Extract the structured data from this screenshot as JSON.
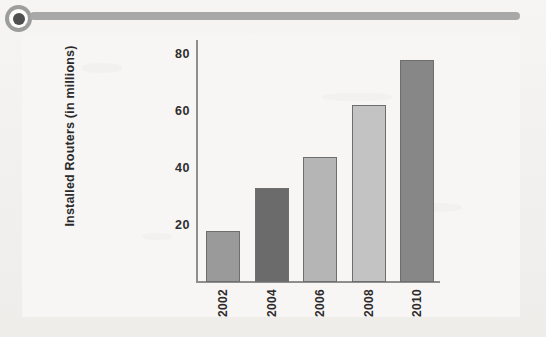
{
  "page": {
    "background_color": "#f3f2f0",
    "panel_color": "#f7f6f4"
  },
  "ornament": {
    "target_icon_name": "target-icon",
    "rule_color": "#a8a8a8",
    "icon_ring_color": "#9d9d9d",
    "icon_core_color": "#4f4f4f"
  },
  "chart_data": {
    "type": "bar",
    "title": "",
    "xlabel": "",
    "ylabel": "Installed Routers (in millions)",
    "categories": [
      "2002",
      "2004",
      "2006",
      "2008",
      "2010"
    ],
    "values": [
      18,
      33,
      44,
      62,
      78
    ],
    "ylim": [
      0,
      86
    ],
    "yticks": [
      20,
      40,
      60,
      80
    ],
    "ytick_labels": [
      "20",
      "40",
      "60",
      "80"
    ],
    "grid": false,
    "legend": false,
    "legend_position": "none",
    "bar_colors": [
      "#9a9a9a",
      "#6b6b6b",
      "#b5b5b5",
      "#c3c3c3",
      "#878787"
    ],
    "bar_edge_color": "#6e6e6e",
    "axis_color": "#8e8e8e",
    "xtick_rotation": 90,
    "ylabel_rotation": 90,
    "series": [
      {
        "name": "Installed Routers",
        "values": [
          18,
          33,
          44,
          62,
          78
        ]
      }
    ],
    "points": [
      {
        "category": "2002",
        "value": 18
      },
      {
        "category": "2004",
        "value": 33
      },
      {
        "category": "2006",
        "value": 44
      },
      {
        "category": "2008",
        "value": 62
      },
      {
        "category": "2010",
        "value": 78
      }
    ]
  }
}
